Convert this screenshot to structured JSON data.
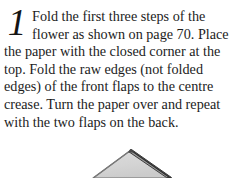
{
  "page": {
    "background_color": "#ffffff",
    "text_color": "#1c1c1c"
  },
  "instruction": {
    "step_number": "1",
    "full_text": "Fold the first three steps of the flower as shown on page 70. Place the paper with the closed corner at the top. Fold the raw edges (not folded edges) of the front flaps to the centre crease. Turn the paper over and repeat with the two flaps on the back.",
    "lines": [
      "Fold the first three steps of the",
      "flower as shown on page 70. Place",
      "the paper with the closed corner at the",
      "top. Fold the raw edges (not folded",
      "edges) of the front flaps to the centre",
      "crease. Turn the paper over and repeat",
      "with the two flaps on the back."
    ],
    "referenced_page": "70"
  },
  "diagram": {
    "name": "origami-diamond-fold",
    "fill_color": "#d6d6d6",
    "edge_color": "#3a3a3a",
    "flap_shade_color": "#8f8f8f",
    "apex_x": 131,
    "apex_y": 20,
    "left_x": 95,
    "right_x": 170
  }
}
